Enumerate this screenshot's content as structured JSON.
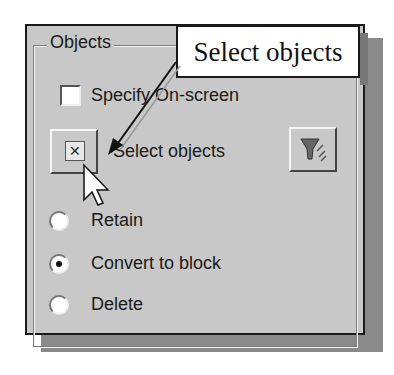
{
  "group": {
    "title": "Objects"
  },
  "specify_onscreen": {
    "label": "Specify On-screen",
    "checked": false
  },
  "select_objects": {
    "label": "Select objects",
    "icon": "select-objects-icon"
  },
  "quick_select": {
    "icon": "quick-select-filter-icon"
  },
  "options": [
    {
      "label": "Retain",
      "selected": false
    },
    {
      "label": "Convert to block",
      "selected": true
    },
    {
      "label": "Delete",
      "selected": false
    }
  ],
  "callout": {
    "text": "Select objects"
  },
  "colors": {
    "panel": "#c8c8c8",
    "shadow": "#8a8a8a",
    "border": "#1a1a1a"
  }
}
